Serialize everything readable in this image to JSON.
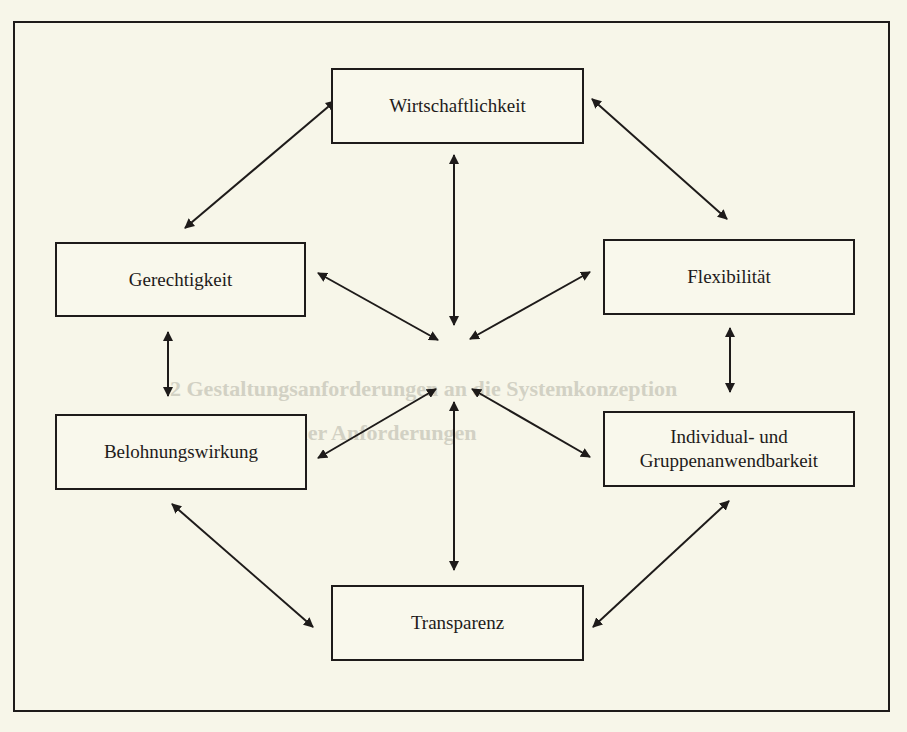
{
  "diagram": {
    "type": "relationship-map",
    "layout": "six criteria arranged around a central convergence point, connected by double-headed arrows",
    "colors": {
      "background": "#f7f6e9",
      "stroke": "#1e1b1a",
      "text": "#1e1b1a"
    },
    "nodes": {
      "wirtschaftlichkeit": {
        "label": "Wirtschaftlichkeit"
      },
      "gerechtigkeit": {
        "label": "Gerechtigkeit"
      },
      "flexibilitaet": {
        "label": "Flexibilität"
      },
      "belohnungswirkung": {
        "label": "Belohnungswirkung"
      },
      "individual": {
        "label_line1": "Individual- und",
        "label_line2": "Gruppenanwendbarkeit"
      },
      "transparenz": {
        "label": "Transparenz"
      }
    },
    "edges": [
      {
        "from": "Wirtschaftlichkeit",
        "to": "Gerechtigkeit",
        "style": "double-headed"
      },
      {
        "from": "Wirtschaftlichkeit",
        "to": "Flexibilität",
        "style": "double-headed"
      },
      {
        "from": "Gerechtigkeit",
        "to": "Belohnungswirkung",
        "style": "double-headed"
      },
      {
        "from": "Flexibilität",
        "to": "Individual- und Gruppenanwendbarkeit",
        "style": "double-headed"
      },
      {
        "from": "Belohnungswirkung",
        "to": "Transparenz",
        "style": "double-headed"
      },
      {
        "from": "Individual- und Gruppenanwendbarkeit",
        "to": "Transparenz",
        "style": "double-headed"
      },
      {
        "from": "Wirtschaftlichkeit",
        "to": "center",
        "style": "double-headed"
      },
      {
        "from": "Gerechtigkeit",
        "to": "center",
        "style": "double-headed"
      },
      {
        "from": "Flexibilität",
        "to": "center",
        "style": "double-headed"
      },
      {
        "from": "Belohnungswirkung",
        "to": "center",
        "style": "double-headed"
      },
      {
        "from": "Individual- und Gruppenanwendbarkeit",
        "to": "center",
        "style": "double-headed"
      },
      {
        "from": "Transparenz",
        "to": "center",
        "style": "double-headed"
      }
    ]
  },
  "bleed_through": {
    "heading_line1": "2 Gestaltungsanforderungen an die Systemkonzeption",
    "heading_line2": "aus Sicht der Anforderungen"
  }
}
